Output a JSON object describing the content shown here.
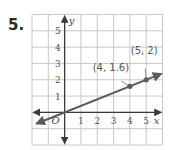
{
  "problem": {
    "number": "5."
  },
  "chart_data": {
    "type": "line",
    "title": "",
    "xlabel": "x",
    "ylabel": "y",
    "origin_label": "O",
    "xlim": [
      -2,
      6
    ],
    "ylim": [
      -2,
      6
    ],
    "grid": true,
    "x_ticks": [
      1,
      2,
      3,
      4,
      5
    ],
    "y_ticks": [
      1,
      2,
      3,
      4,
      5
    ],
    "series": [
      {
        "name": "line",
        "slope": 0.4,
        "intercept": 0,
        "x_range": [
          -1.7,
          5.9
        ],
        "color": "#5a5a5a",
        "points": [
          {
            "x": 4,
            "y": 1.6,
            "label": "(4, 1.6)"
          },
          {
            "x": 5,
            "y": 2,
            "label": "(5, 2)"
          }
        ]
      }
    ]
  }
}
